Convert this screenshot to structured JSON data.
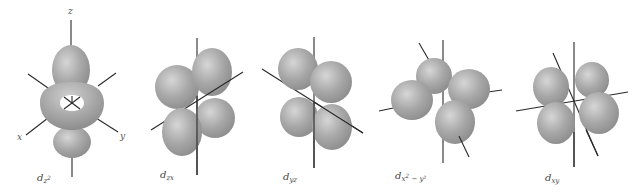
{
  "figure": {
    "lobe_color": "#a6a6a6",
    "lobe_highlight": "#d4d4d4",
    "lobe_shadow": "#8a8a8a",
    "axis_color": "#2a2a2a",
    "orbitals": [
      {
        "id": "dz2",
        "label_main": "d",
        "label_sub": "z",
        "label_sup": "2",
        "label_extra": ""
      },
      {
        "id": "dzx",
        "label_main": "d",
        "label_sub": "zx",
        "label_sup": "",
        "label_extra": ""
      },
      {
        "id": "dyz",
        "label_main": "d",
        "label_sub": "yz",
        "label_sup": "",
        "label_extra": ""
      },
      {
        "id": "dx2-y2",
        "label_main": "d",
        "label_sub": "x",
        "label_sup": "2",
        "label_extra": " − y²"
      },
      {
        "id": "dxy",
        "label_main": "d",
        "label_sub": "xy",
        "label_sup": "",
        "label_extra": ""
      }
    ],
    "axis_labels": {
      "z": "z",
      "x": "x",
      "y": "y"
    }
  }
}
